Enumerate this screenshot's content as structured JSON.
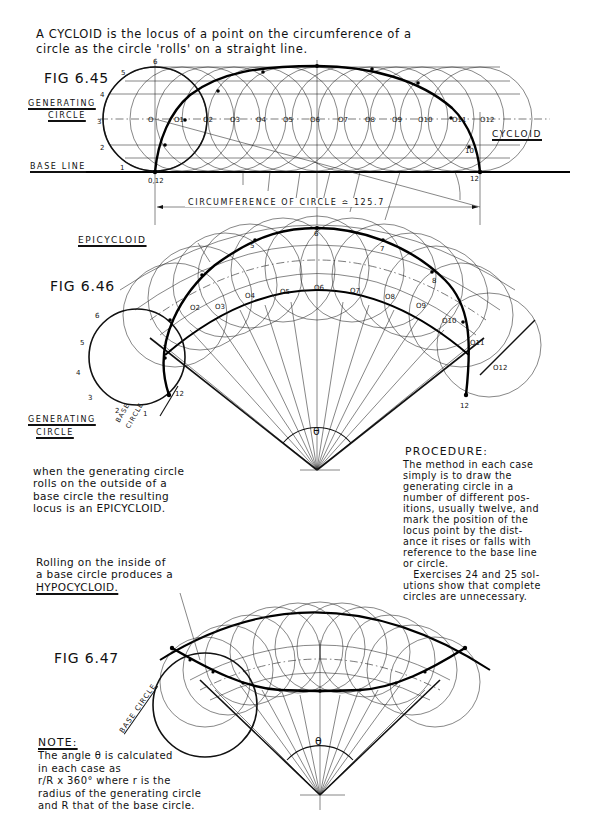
{
  "intro": {
    "line1": "A CYCLOID is the locus of a point on the circumference of a",
    "line2": "circle as the circle 'rolls' on a straight line."
  },
  "fig645": {
    "title": "FIG 6.45",
    "generating_label_1": "GENERATING",
    "generating_label_2": "CIRCLE",
    "base_line_label": "BASE LINE",
    "cycloid_label": "CYCLOID",
    "dimension_label": "CIRCUMFERENCE OF CIRCLE ≏ 125.7",
    "start_point": "0,12",
    "end_point": "12",
    "circle_points": [
      "1",
      "2",
      "3",
      "4",
      "5",
      "6"
    ],
    "centres": [
      "O",
      "O1",
      "O2",
      "O3",
      "O4",
      "O5",
      "O6",
      "O7",
      "O8",
      "O9",
      "O10",
      "O11",
      "O12"
    ]
  },
  "fig646": {
    "title": "FIG 6.46",
    "epicycloid_label": "EPICYCLOID",
    "generating_label_1": "GENERATING",
    "generating_label_2": "CIRCLE",
    "base_circle_label_1": "BASE",
    "base_circle_label_2": "CIRCLE",
    "theta": "θ",
    "start_point": "12",
    "end_point": "12",
    "centres": [
      "O",
      "O1",
      "O2",
      "O3",
      "O4",
      "O5",
      "O6",
      "O7",
      "O8",
      "O9",
      "O10",
      "O11",
      "O12"
    ],
    "description": [
      "when the generating circle",
      "rolls on the outside of a",
      "base circle the resulting",
      "locus is an EPICYCLOID."
    ]
  },
  "procedure": {
    "title": "PROCEDURE:",
    "lines": [
      "The method in each case",
      "simply is to draw the",
      "generating circle in a",
      "number of different pos-",
      "itions, usually twelve, and",
      "mark the position of the",
      "locus point by the dist-",
      "ance it rises or falls with",
      "reference to the base line",
      "or circle.",
      "   Exercises 24 and 25 sol-",
      "utions show that complete",
      "circles are unnecessary."
    ]
  },
  "fig647": {
    "title": "FIG 6.47",
    "base_circle_label": "BASE CIRCLE",
    "theta": "θ",
    "description": [
      "Rolling on the inside of",
      "a base circle produces a"
    ],
    "hypocycloid_label": "HYPOCYCLOID."
  },
  "note": {
    "title": "NOTE:",
    "lines": [
      "The angle θ is calculated",
      "in each case as",
      "r/R x 360° where r is the",
      "radius of the generating circle",
      "and R that of the base circle."
    ]
  }
}
